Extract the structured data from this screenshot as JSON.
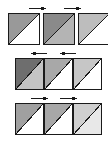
{
  "figure": {
    "background_color": "#ffffff",
    "border_color": "#1a1a1a",
    "width": 108,
    "height": 145,
    "rows": [
      {
        "id": "row-1",
        "name": "top-row",
        "spacing": "separated",
        "y": 13,
        "cell_height": 32,
        "cells": [
          {
            "index": 0,
            "x": 8,
            "width": 32,
            "upper_fill": "#999999",
            "lower_fill": "#ffffff",
            "split": "main-diagonal"
          },
          {
            "index": 1,
            "x": 43,
            "width": 32,
            "upper_fill": "#8a8a8a",
            "lower_fill": "#b4b4b4",
            "split": "main-diagonal"
          },
          {
            "index": 2,
            "x": 78,
            "width": 32,
            "upper_fill": "#bdbdbd",
            "lower_fill": "#ffffff",
            "split": "main-diagonal"
          }
        ],
        "arrows": [
          {
            "index": 0,
            "direction": "right",
            "x_start": 29,
            "x_end": 46,
            "y": 8
          },
          {
            "index": 1,
            "direction": "right",
            "x_start": 64,
            "x_end": 81,
            "y": 8
          }
        ]
      },
      {
        "id": "row-2",
        "name": "middle-row",
        "spacing": "adjacent",
        "y": 58,
        "cell_height": 32,
        "cells": [
          {
            "index": 0,
            "x": 15,
            "width": 29,
            "upper_fill": "#6e6e6e",
            "lower_fill": "#c4c4c4",
            "split": "main-diagonal"
          },
          {
            "index": 1,
            "x": 44,
            "width": 29,
            "upper_fill": "#a8a8a8",
            "lower_fill": "#ffffff",
            "split": "main-diagonal"
          },
          {
            "index": 2,
            "x": 73,
            "width": 29,
            "upper_fill": "#c6c6c6",
            "lower_fill": "#ffffff",
            "split": "main-diagonal"
          }
        ],
        "arrows": [
          {
            "index": 0,
            "direction": "left",
            "x_start": 47,
            "x_end": 31,
            "y": 53
          },
          {
            "index": 1,
            "direction": "left",
            "x_start": 76,
            "x_end": 60,
            "y": 53
          }
        ]
      },
      {
        "id": "row-3",
        "name": "bottom-row",
        "spacing": "adjacent",
        "y": 103,
        "cell_height": 32,
        "cells": [
          {
            "index": 0,
            "x": 15,
            "width": 29,
            "upper_fill": "#a0a0a0",
            "lower_fill": "#ffffff",
            "split": "main-diagonal"
          },
          {
            "index": 1,
            "x": 44,
            "width": 29,
            "upper_fill": "#a8a8a8",
            "lower_fill": "#ffffff",
            "split": "main-diagonal"
          },
          {
            "index": 2,
            "x": 73,
            "width": 29,
            "upper_fill": "#cfcfcf",
            "lower_fill": "#e8e8e8",
            "split": "main-diagonal"
          }
        ],
        "arrows": [
          {
            "index": 0,
            "direction": "right",
            "x_start": 31,
            "x_end": 48,
            "y": 98
          },
          {
            "index": 1,
            "direction": "right",
            "x_start": 60,
            "x_end": 77,
            "y": 98
          }
        ]
      }
    ]
  }
}
